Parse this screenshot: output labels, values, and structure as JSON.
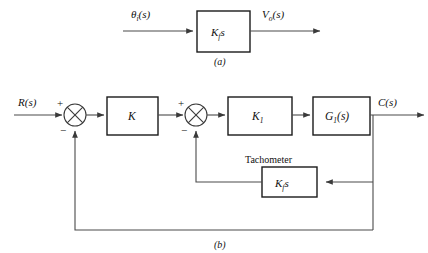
{
  "figure": {
    "kind": "control-system-block-diagram",
    "background_color": "#ffffff",
    "line_color": "#4a4a4a",
    "box_stroke_color": "#1a1a1a",
    "text_color": "#111111"
  },
  "part_a": {
    "caption": "(a)",
    "input_label": "θ",
    "input_subscript": "i",
    "input_suffix": "(s)",
    "block_label": "K",
    "block_subscript": "f",
    "block_suffix": "s",
    "output_label": "V",
    "output_subscript": "o",
    "output_suffix": "(s)"
  },
  "part_b": {
    "caption": "(b)",
    "input_label": "R(s)",
    "output_label": "C(s)",
    "tachometer_label": "Tachometer",
    "summing_junction_1": {
      "plus_sign": "+",
      "minus_sign": "−"
    },
    "summing_junction_2": {
      "plus_sign": "+",
      "minus_sign": "−"
    },
    "block_gain": "K",
    "block_gain_1_label": "K",
    "block_gain_1_subscript": "1",
    "block_plant_label": "G",
    "block_plant_subscript": "1",
    "block_plant_suffix": "(s)",
    "block_tach_label": "K",
    "block_tach_subscript": "f",
    "block_tach_suffix": "s"
  }
}
